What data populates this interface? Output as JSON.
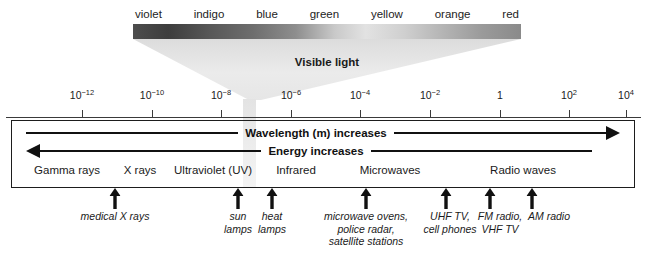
{
  "figure": {
    "visible_light_label": "Visible light"
  },
  "visible_light": {
    "colors": [
      {
        "name": "violet"
      },
      {
        "name": "indigo"
      },
      {
        "name": "blue"
      },
      {
        "name": "green"
      },
      {
        "name": "yellow"
      },
      {
        "name": "orange"
      },
      {
        "name": "red"
      }
    ]
  },
  "axis": {
    "unit": "m",
    "ticks": [
      {
        "label_base": "10",
        "label_exp": "−12",
        "x": 82
      },
      {
        "label_base": "10",
        "label_exp": "−10",
        "x": 152
      },
      {
        "label_base": "10",
        "label_exp": "−8",
        "x": 221
      },
      {
        "label_base": "10",
        "label_exp": "−6",
        "x": 291
      },
      {
        "label_base": "10",
        "label_exp": "−4",
        "x": 360
      },
      {
        "label_base": "10",
        "label_exp": "−2",
        "x": 430
      },
      {
        "label_base": "1",
        "label_exp": "",
        "x": 500
      },
      {
        "label_base": "10",
        "label_exp": "2",
        "x": 569
      },
      {
        "label_base": "10",
        "label_exp": "4",
        "x": 626
      }
    ]
  },
  "directions": {
    "wavelength": "Wavelength (m) increases",
    "energy": "Energy increases"
  },
  "bands": [
    {
      "name": "Gamma rays",
      "x": 67
    },
    {
      "name": "X rays",
      "x": 140
    },
    {
      "name": "Ultraviolet (UV)",
      "x": 213
    },
    {
      "name": "Infrared",
      "x": 296
    },
    {
      "name": "Microwaves",
      "x": 390
    },
    {
      "name": "Radio waves",
      "x": 523
    }
  ],
  "callouts": [
    {
      "caption": "medical X rays",
      "x": 115,
      "caption_x": 115
    },
    {
      "caption": "sun\nlamps",
      "x": 238,
      "caption_x": 238
    },
    {
      "caption": "heat\nlamps",
      "x": 272,
      "caption_x": 272
    },
    {
      "caption": "microwave ovens,\npolice radar,\nsatellite stations",
      "x": 366,
      "caption_x": 366
    },
    {
      "caption": "UHF TV,\ncell phones",
      "x": 446,
      "caption_x": 450
    },
    {
      "caption": "FM radio,\nVHF TV",
      "x": 490,
      "caption_x": 500
    },
    {
      "caption": "AM radio",
      "x": 532,
      "caption_x": 549
    }
  ],
  "colors": {
    "ink": "#1a1a1a",
    "line": "#111111",
    "box_border": "#1d1d1d",
    "funnel": "#e8e8e8"
  }
}
